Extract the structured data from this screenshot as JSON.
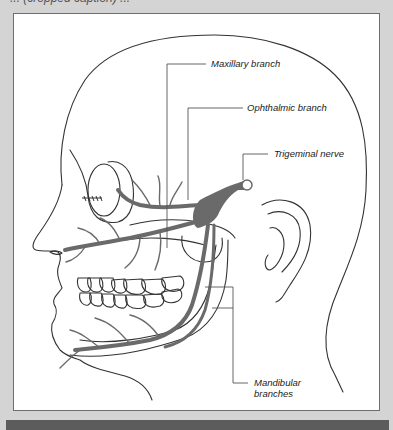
{
  "figure": {
    "caption_partial": "... (cropped caption) ...",
    "labels": {
      "maxillary": "Maxillary branch",
      "ophthalmic": "Ophthalmic branch",
      "trigeminal": "Trigeminal nerve",
      "mandibular_line1": "Mandibular",
      "mandibular_line2": "branches"
    },
    "colors": {
      "frame": "#d4d4d4",
      "panel": "#ffffff",
      "outline": "#333333",
      "nerve": "#6a6a6a",
      "bottom_bar": "#5c5c5c"
    }
  }
}
